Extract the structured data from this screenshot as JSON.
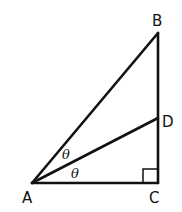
{
  "diagram": {
    "type": "right-triangle",
    "points": {
      "A": {
        "label": "A",
        "x": 32,
        "y": 183
      },
      "B": {
        "label": "B",
        "x": 158,
        "y": 33
      },
      "C": {
        "label": "C",
        "x": 158,
        "y": 183
      },
      "D": {
        "label": "D",
        "x": 158,
        "y": 118
      }
    },
    "segments": [
      "AB",
      "BC",
      "AC",
      "AD"
    ],
    "angles": [
      {
        "label": "θ",
        "between": "BAD"
      },
      {
        "label": "θ",
        "between": "DAC"
      }
    ],
    "right_angle_at": "C",
    "stroke_color": "#111111"
  }
}
